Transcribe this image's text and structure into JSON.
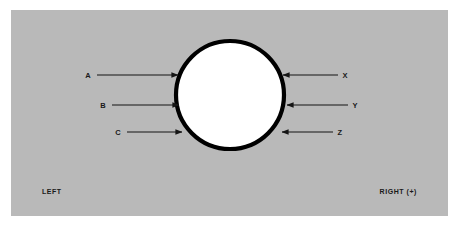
{
  "figure": {
    "type": "free-body-diagram",
    "background_color": "#ffffff",
    "panel_color": "#b9b9b9",
    "body": {
      "shape": "circle",
      "fill_color": "#ffffff",
      "stroke_color": "#000000",
      "center_x": 230,
      "center_y": 95,
      "radius": 54
    },
    "left_axis_label": "LEFT",
    "right_axis_label": "RIGHT (+)",
    "left_forces": [
      {
        "label": "A",
        "label_x": 88,
        "line_start_x": 97,
        "line_end_x": 178,
        "y": 75,
        "direction": "right"
      },
      {
        "label": "B",
        "label_x": 103,
        "line_start_x": 112,
        "line_end_x": 179,
        "y": 105,
        "direction": "right"
      },
      {
        "label": "C",
        "label_x": 118,
        "line_start_x": 127,
        "line_end_x": 182,
        "y": 132,
        "direction": "right"
      }
    ],
    "right_forces": [
      {
        "label": "X",
        "label_x": 345,
        "line_start_x": 338,
        "line_end_x": 282,
        "y": 75,
        "direction": "left"
      },
      {
        "label": "Y",
        "label_x": 355,
        "line_start_x": 348,
        "line_end_x": 286,
        "y": 105,
        "direction": "left"
      },
      {
        "label": "Z",
        "label_x": 340,
        "line_start_x": 333,
        "line_end_x": 281,
        "y": 132,
        "direction": "left"
      }
    ]
  }
}
